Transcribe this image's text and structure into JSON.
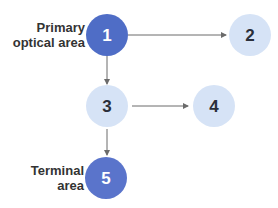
{
  "diagram": {
    "nodes": [
      {
        "id": "1",
        "label": "1",
        "style": "dark"
      },
      {
        "id": "2",
        "label": "2",
        "style": "light"
      },
      {
        "id": "3",
        "label": "3",
        "style": "light"
      },
      {
        "id": "4",
        "label": "4",
        "style": "light"
      },
      {
        "id": "5",
        "label": "5",
        "style": "dark"
      }
    ],
    "edges": [
      {
        "from": "1",
        "to": "2"
      },
      {
        "from": "1",
        "to": "3"
      },
      {
        "from": "3",
        "to": "4"
      },
      {
        "from": "3",
        "to": "5"
      }
    ],
    "annotations": {
      "primary_line1": "Primary",
      "primary_line2": "optical area",
      "terminal_line1": "Terminal",
      "terminal_line2": "area"
    },
    "colors": {
      "dark_fill": "#4f6dc6",
      "dark_text": "#ffffff",
      "light_fill": "#d6e3f6",
      "light_text": "#2a2f3a",
      "edge": "#6b6b6b",
      "label_text": "#333333"
    }
  }
}
